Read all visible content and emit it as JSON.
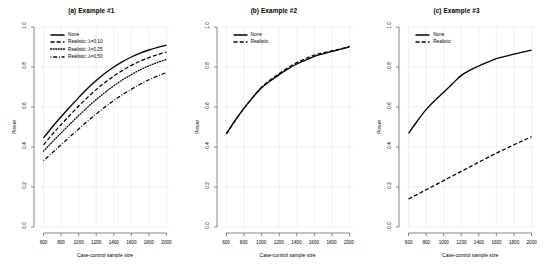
{
  "figure": {
    "background": "#ffffff",
    "line_color": "#000000",
    "grid_color": "#e6e6e6",
    "axis_color": "#555555"
  },
  "panels": [
    {
      "id": "panel-a",
      "title": "(a) Example #1",
      "xlabel": "Case-control sample size",
      "ylabel": "Power",
      "legend": [
        {
          "label": "None",
          "style": "solid"
        },
        {
          "label": "Realistic: λ=0.10",
          "style": "dashed"
        },
        {
          "label": "Realistic: λ=0.25",
          "style": "dotted"
        },
        {
          "label": "Realistic: λ=0.50",
          "style": "dashdot"
        }
      ]
    },
    {
      "id": "panel-b",
      "title": "(b) Example #2",
      "xlabel": "Case-control sample size",
      "ylabel": "Power",
      "legend": [
        {
          "label": "None",
          "style": "solid"
        },
        {
          "label": "Realistic",
          "style": "dashed"
        }
      ]
    },
    {
      "id": "panel-c",
      "title": "(c) Example #3",
      "xlabel": "Case-control sample size",
      "ylabel": "Power",
      "legend": [
        {
          "label": "None",
          "style": "solid"
        },
        {
          "label": "Realistic",
          "style": "dashed"
        }
      ]
    }
  ],
  "axis": {
    "xticks": [
      600,
      800,
      1000,
      1200,
      1400,
      1600,
      1800,
      2000
    ],
    "xtick_labels": [
      "600",
      "800",
      "1000",
      "1200",
      "1400",
      "1600",
      "1800",
      "2000"
    ],
    "yticks": [
      0.0,
      0.2,
      0.4,
      0.6,
      0.8,
      1.0
    ],
    "ytick_labels": [
      "0.0",
      "0.2",
      "0.4",
      "0.6",
      "0.8",
      "1.0"
    ],
    "xlim": [
      560,
      2040
    ],
    "ylim": [
      0.0,
      1.0
    ]
  },
  "chart_data": [
    {
      "type": "line",
      "title": "(a) Example #1",
      "xlabel": "Case-control sample size",
      "ylabel": "Power",
      "xlim": [
        560,
        2040
      ],
      "ylim": [
        0.0,
        1.0
      ],
      "grid": true,
      "legend_position": "top-left",
      "x": [
        600,
        700,
        800,
        900,
        1000,
        1100,
        1200,
        1300,
        1400,
        1500,
        1600,
        1700,
        1800,
        1900,
        2000
      ],
      "series": [
        {
          "name": "None",
          "style": "solid",
          "values": [
            0.445,
            0.5,
            0.551,
            0.6,
            0.647,
            0.693,
            0.733,
            0.769,
            0.8,
            0.827,
            0.85,
            0.869,
            0.885,
            0.898,
            0.909
          ]
        },
        {
          "name": "Realistic: λ=0.10",
          "style": "dashed",
          "values": [
            0.411,
            0.463,
            0.512,
            0.559,
            0.604,
            0.647,
            0.687,
            0.723,
            0.755,
            0.783,
            0.808,
            0.829,
            0.847,
            0.862,
            0.875
          ]
        },
        {
          "name": "Realistic: λ=0.25",
          "style": "dotted",
          "values": [
            0.379,
            0.425,
            0.47,
            0.514,
            0.557,
            0.598,
            0.637,
            0.673,
            0.706,
            0.736,
            0.762,
            0.786,
            0.806,
            0.823,
            0.838
          ]
        },
        {
          "name": "Realistic: λ=0.50",
          "style": "dashdot",
          "values": [
            0.331,
            0.371,
            0.411,
            0.451,
            0.49,
            0.528,
            0.565,
            0.6,
            0.632,
            0.662,
            0.689,
            0.714,
            0.736,
            0.755,
            0.772
          ]
        }
      ]
    },
    {
      "type": "line",
      "title": "(b) Example #2",
      "xlabel": "Case-control sample size",
      "ylabel": "Power",
      "xlim": [
        560,
        2040
      ],
      "ylim": [
        0.0,
        1.0
      ],
      "grid": true,
      "legend_position": "top-left",
      "x": [
        600,
        700,
        800,
        900,
        1000,
        1100,
        1200,
        1300,
        1400,
        1500,
        1600,
        1700,
        1800,
        1900,
        2000
      ],
      "series": [
        {
          "name": "None",
          "style": "solid",
          "values": [
            0.468,
            0.534,
            0.594,
            0.648,
            0.696,
            0.731,
            0.762,
            0.791,
            0.815,
            0.834,
            0.853,
            0.866,
            0.878,
            0.889,
            0.901
          ]
        },
        {
          "name": "Realistic",
          "style": "dashed",
          "values": [
            0.465,
            0.532,
            0.593,
            0.649,
            0.7,
            0.736,
            0.767,
            0.797,
            0.822,
            0.842,
            0.86,
            0.871,
            0.881,
            0.891,
            0.903
          ]
        }
      ]
    },
    {
      "type": "line",
      "title": "(c) Example #3",
      "xlabel": "Case-control sample size",
      "ylabel": "Power",
      "xlim": [
        560,
        2040
      ],
      "ylim": [
        0.0,
        1.0
      ],
      "grid": true,
      "legend_position": "top-left",
      "x": [
        600,
        700,
        800,
        900,
        1000,
        1100,
        1200,
        1300,
        1400,
        1500,
        1600,
        1700,
        1800,
        1900,
        2000
      ],
      "series": [
        {
          "name": "None",
          "style": "solid",
          "values": [
            0.468,
            0.53,
            0.587,
            0.633,
            0.674,
            0.716,
            0.758,
            0.784,
            0.805,
            0.824,
            0.842,
            0.853,
            0.864,
            0.874,
            0.884
          ]
        },
        {
          "name": "Realistic",
          "style": "dashed",
          "values": [
            0.14,
            0.163,
            0.186,
            0.209,
            0.232,
            0.255,
            0.278,
            0.301,
            0.324,
            0.347,
            0.369,
            0.39,
            0.411,
            0.431,
            0.452
          ]
        }
      ]
    }
  ]
}
